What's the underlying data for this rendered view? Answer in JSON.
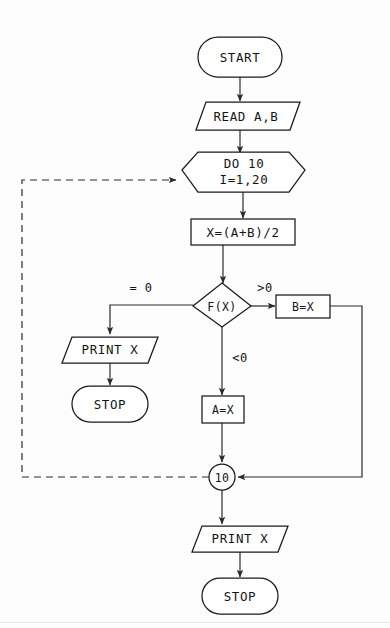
{
  "diagram": {
    "type": "flowchart",
    "background_color": "#fdfdfd",
    "line_color": "#2a2a2a",
    "text_color": "#141414"
  },
  "nodes": {
    "start": {
      "label": "START",
      "shape": "terminator",
      "cx": 240,
      "cy": 57,
      "w": 84,
      "h": 40
    },
    "read": {
      "label": "READ A,B",
      "shape": "parallelogram",
      "cx": 240,
      "cy": 116,
      "w": 104,
      "h": 28
    },
    "do_loop_line1": {
      "label": "DO 10",
      "shape": "hexagon",
      "cx": 243,
      "cy": 170,
      "w": 122,
      "h": 44
    },
    "do_loop_line2": {
      "label": "I=1,20"
    },
    "assign_x": {
      "label": "X=(A+B)/2",
      "shape": "process",
      "cx": 243,
      "cy": 232,
      "w": 104,
      "h": 26
    },
    "decision": {
      "label": "F(X)",
      "shape": "diamond",
      "cx": 222,
      "cy": 305,
      "w": 58,
      "h": 44
    },
    "assign_b": {
      "label": "B=X",
      "shape": "process",
      "cx": 303,
      "cy": 307,
      "w": 54,
      "h": 24
    },
    "assign_a": {
      "label": "A=X",
      "shape": "process",
      "cx": 223,
      "cy": 410,
      "w": 42,
      "h": 26
    },
    "print_left": {
      "label": "PRINT X",
      "shape": "parallelogram",
      "cx": 110,
      "cy": 350,
      "w": 96,
      "h": 26
    },
    "stop_left": {
      "label": "STOP",
      "shape": "terminator",
      "cx": 110,
      "cy": 404,
      "w": 76,
      "h": 36
    },
    "connector_10": {
      "label": "10",
      "shape": "circle",
      "cx": 222,
      "cy": 477,
      "r": 13
    },
    "print_bottom": {
      "label": "PRINT X",
      "shape": "parallelogram",
      "cx": 240,
      "cy": 539,
      "w": 96,
      "h": 26
    },
    "stop_bottom": {
      "label": "STOP",
      "shape": "terminator",
      "cx": 240,
      "cy": 597,
      "w": 76,
      "h": 36
    }
  },
  "edge_labels": {
    "equal_zero": "= 0",
    "greater_zero": ">0",
    "less_zero": "<0"
  },
  "edges": [
    {
      "from": "start",
      "to": "read",
      "style": "solid"
    },
    {
      "from": "read",
      "to": "do_loop",
      "style": "solid"
    },
    {
      "from": "do_loop",
      "to": "assign_x",
      "style": "solid"
    },
    {
      "from": "assign_x",
      "to": "decision",
      "style": "solid"
    },
    {
      "from": "decision",
      "to": "print_left",
      "style": "solid",
      "label": "= 0"
    },
    {
      "from": "decision",
      "to": "assign_b",
      "style": "solid",
      "label": ">0"
    },
    {
      "from": "decision",
      "to": "assign_a",
      "style": "solid",
      "label": "<0"
    },
    {
      "from": "print_left",
      "to": "stop_left",
      "style": "solid"
    },
    {
      "from": "assign_a",
      "to": "connector_10",
      "style": "solid"
    },
    {
      "from": "assign_b",
      "to": "connector_10",
      "style": "solid"
    },
    {
      "from": "connector_10",
      "to": "do_loop",
      "style": "dashed"
    },
    {
      "from": "connector_10",
      "to": "print_bottom",
      "style": "solid"
    },
    {
      "from": "print_bottom",
      "to": "stop_bottom",
      "style": "solid"
    }
  ]
}
